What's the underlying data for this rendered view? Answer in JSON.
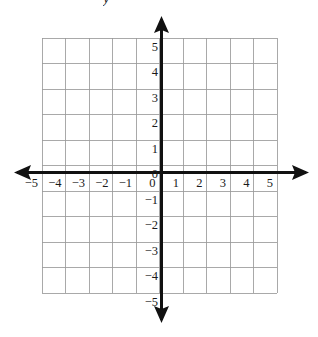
{
  "figure": {
    "title": "",
    "background_color": "#ffffff",
    "axis_color": "#111111",
    "grid_color": "#9a9a9a",
    "label_color": "#1a1a1a",
    "y_axis_name_partial": "y"
  },
  "chart_data": {
    "type": "scatter",
    "title": "",
    "subtitle": "",
    "xlabel": "",
    "ylabel": "y",
    "xlim": [
      -5,
      5
    ],
    "ylim": [
      -5,
      5
    ],
    "grid": true,
    "legend": null,
    "legend_position": "none",
    "x_tick_labels": [
      "−5",
      "−4",
      "−3",
      "−2",
      "−1",
      "0",
      "1",
      "2",
      "3",
      "4",
      "5"
    ],
    "x_tick_values": [
      -5,
      -4,
      -3,
      -2,
      -1,
      0,
      1,
      2,
      3,
      4,
      5
    ],
    "y_tick_labels": [
      "5",
      "4",
      "3",
      "2",
      "1",
      "0",
      "−1",
      "−2",
      "−3",
      "−4",
      "−5"
    ],
    "y_tick_values": [
      5,
      4,
      3,
      2,
      1,
      0,
      -1,
      -2,
      -3,
      -4,
      -5
    ],
    "series": [],
    "annotations": [],
    "arrows": [
      "left",
      "right",
      "up",
      "down"
    ]
  },
  "axes": {
    "x_axis_name": "x-axis",
    "y_axis_name": "y-axis",
    "origin_label": "0"
  }
}
